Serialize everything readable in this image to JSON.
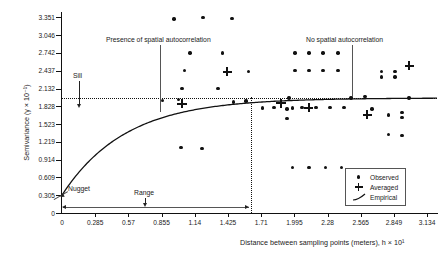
{
  "chart_data": {
    "type": "scatter",
    "title": "",
    "xlabel": "Distance between sampling points (meters), h × 10¹",
    "ylabel": "Semivariance (γ × 10⁻¹)",
    "xlim": [
      0,
      3.2193
    ],
    "ylim": [
      0,
      3.4248
    ],
    "xticks": [
      "0",
      "0.285",
      "0.57",
      "0.855",
      "1.14",
      "1.425",
      "1.71",
      "1.995",
      "2.28",
      "2.565",
      "2.849",
      "3.134"
    ],
    "xtick_values": [
      0,
      0.285,
      0.57,
      0.855,
      1.14,
      1.425,
      1.71,
      1.995,
      2.28,
      2.565,
      2.849,
      3.134
    ],
    "yticks": [
      "0",
      "0.305",
      "0.609",
      "0.914",
      "1.219",
      "1.523",
      "1.828",
      "2.132",
      "2.437",
      "2.742",
      "3.046",
      "3.351"
    ],
    "ytick_values": [
      0,
      0.305,
      0.609,
      0.914,
      1.219,
      1.523,
      1.828,
      2.132,
      2.437,
      2.742,
      3.046,
      3.351
    ],
    "grid": false,
    "legend_position": "bottom-right",
    "legend": [
      {
        "label": "Observed",
        "marker": "dot"
      },
      {
        "label": "Averaged",
        "marker": "plus"
      },
      {
        "label": "Empirical",
        "marker": "line"
      }
    ],
    "annotations": [
      {
        "text": "Presence of spatial autocorrelation",
        "x": 1.02,
        "y": 3.05,
        "points_to_x": 1.02,
        "points_to_y": 1.92
      },
      {
        "text": "No spatial autocorrelation",
        "x": 2.49,
        "y": 3.05,
        "points_to_x": 2.49,
        "points_to_y": 1.97
      },
      {
        "text": "Sill",
        "x": 0.3,
        "y": 2.3,
        "points_to_x": 0.3,
        "points_to_y": 1.97
      },
      {
        "text": "Nugget",
        "x": 0.2,
        "y": 0.53,
        "points_to_x": 0.02,
        "points_to_y": 0.3
      },
      {
        "text": "Range",
        "x": 0.94,
        "y": 0.22,
        "points_to_x": 0.94,
        "points_to_y": 0.07
      }
    ],
    "reference_lines": [
      {
        "name": "sill",
        "orientation": "horizontal",
        "value": 1.97,
        "style": "dotted"
      },
      {
        "name": "range",
        "orientation": "vertical",
        "value": 1.62,
        "style": "dotted"
      },
      {
        "name": "autocorrelation-divider",
        "orientation": "vertical",
        "value": 2.49,
        "style": "solid"
      }
    ],
    "range_span": {
      "from": 0.0,
      "to": 1.62,
      "label": "Range"
    },
    "series": [
      {
        "name": "Observed",
        "marker": "dot",
        "points": [
          [
            0.96,
            3.32
          ],
          [
            1.21,
            3.35
          ],
          [
            1.46,
            3.33
          ],
          [
            1.1,
            2.74
          ],
          [
            1.38,
            2.74
          ],
          [
            1.05,
            2.44
          ],
          [
            1.6,
            2.42
          ],
          [
            1.03,
            2.13
          ],
          [
            1.34,
            2.13
          ],
          [
            0.86,
            1.93
          ],
          [
            1.0,
            1.94
          ],
          [
            1.47,
            1.9
          ],
          [
            1.58,
            1.92
          ],
          [
            1.72,
            1.8
          ],
          [
            1.82,
            1.81
          ],
          [
            1.98,
            1.8
          ],
          [
            1.02,
            1.12
          ],
          [
            1.2,
            1.11
          ],
          [
            2.0,
            2.74
          ],
          [
            2.12,
            2.74
          ],
          [
            2.24,
            2.74
          ],
          [
            2.37,
            2.74
          ],
          [
            2.0,
            2.44
          ],
          [
            2.12,
            2.44
          ],
          [
            2.24,
            2.44
          ],
          [
            2.37,
            2.44
          ],
          [
            1.95,
            1.97
          ],
          [
            2.48,
            1.97
          ],
          [
            2.6,
            2.0
          ],
          [
            1.93,
            1.78
          ],
          [
            1.93,
            1.62
          ],
          [
            2.06,
            1.81
          ],
          [
            2.18,
            1.81
          ],
          [
            2.3,
            1.81
          ],
          [
            2.42,
            1.81
          ],
          [
            2.74,
            2.42
          ],
          [
            2.74,
            2.33
          ],
          [
            2.86,
            2.42
          ],
          [
            2.86,
            2.33
          ],
          [
            2.98,
            1.97
          ],
          [
            2.66,
            1.78
          ],
          [
            2.8,
            1.68
          ],
          [
            2.92,
            1.72
          ],
          [
            2.92,
            1.64
          ],
          [
            2.8,
            1.34
          ],
          [
            2.92,
            1.33
          ],
          [
            1.98,
            0.78
          ],
          [
            2.12,
            0.78
          ],
          [
            2.26,
            0.78
          ],
          [
            2.4,
            0.78
          ]
        ]
      },
      {
        "name": "Averaged",
        "marker": "plus",
        "points": [
          [
            1.03,
            1.87
          ],
          [
            1.42,
            2.42
          ],
          [
            1.88,
            1.88
          ],
          [
            2.12,
            1.8
          ],
          [
            2.62,
            1.68
          ],
          [
            2.98,
            2.52
          ]
        ]
      },
      {
        "name": "Empirical",
        "marker": "line",
        "model": "exponential",
        "nugget": 0.305,
        "sill": 1.97,
        "range": 1.62,
        "description": "Fitted empirical semivariogram curve rising from the nugget to the sill"
      }
    ]
  }
}
